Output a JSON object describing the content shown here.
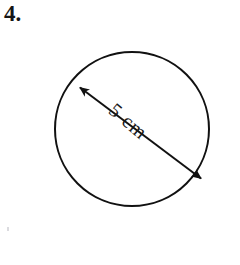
{
  "page": {
    "background_color": "#ffffff",
    "width": 240,
    "height": 265
  },
  "question": {
    "number_label": "4.",
    "text_color": "#151515"
  },
  "figure": {
    "name": "circle-with-diameter",
    "shape": "circle",
    "stroke_color": "#111111",
    "stroke_width": 2,
    "fill": "none",
    "center_x": 132,
    "center_y": 129,
    "radius": 77,
    "diameter_line": {
      "name": "diameter-double-arrow",
      "x1": 78,
      "y1": 86,
      "x2": 203,
      "y2": 180,
      "stroke_color": "#111111",
      "stroke_width": 2,
      "arrow_start": true,
      "arrow_end": true
    },
    "measurement_label": "5 cm",
    "measurement_value": 5,
    "measurement_unit": "cm",
    "label_rotation_degrees": 40
  },
  "artifacts": {
    "speck_color": "#cfcfd4"
  }
}
